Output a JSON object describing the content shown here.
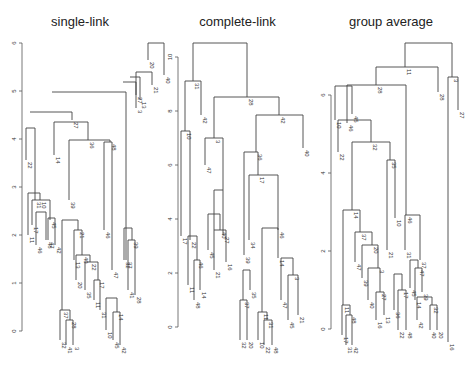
{
  "chart_data": [
    {
      "type": "dendrogram",
      "title": "single-link",
      "ylabel": "",
      "ylim": [
        0,
        6
      ],
      "yticks": [
        "0",
        "1",
        "2",
        "3",
        "4",
        "5",
        "6"
      ],
      "axis": {
        "x": 22,
        "y0": 331,
        "y_top": 43,
        "px_per_unit": 48
      },
      "leaf_labels_visible": [
        "22",
        "11",
        "17",
        "31",
        "46",
        "10",
        "48",
        "47",
        "45",
        "14",
        "42",
        "32",
        "37",
        "41",
        "39",
        "28",
        "27",
        "3",
        "13",
        "20",
        "21",
        "40",
        "35",
        "36"
      ],
      "segments": [
        [
          148,
          43,
          164,
          43
        ],
        [
          148,
          43,
          148,
          60
        ],
        [
          164,
          43,
          164,
          75
        ],
        [
          136,
          72,
          152,
          72
        ],
        [
          152,
          72,
          152,
          85
        ],
        [
          136,
          72,
          136,
          95
        ],
        [
          130,
          77,
          140,
          77
        ],
        [
          140,
          77,
          140,
          100
        ],
        [
          123,
          82,
          136,
          82
        ],
        [
          136,
          82,
          136,
          108
        ],
        [
          52,
          92,
          126,
          92
        ],
        [
          126,
          92,
          126,
          260
        ],
        [
          30,
          112,
          72,
          112
        ],
        [
          72,
          112,
          72,
          120
        ],
        [
          26,
          128,
          35,
          128
        ],
        [
          26,
          128,
          26,
          160
        ],
        [
          35,
          128,
          35,
          200
        ],
        [
          54,
          122,
          88,
          122
        ],
        [
          54,
          122,
          54,
          155
        ],
        [
          88,
          122,
          88,
          140
        ],
        [
          69,
          140,
          110,
          140
        ],
        [
          69,
          140,
          69,
          200
        ],
        [
          110,
          140,
          110,
          142
        ],
        [
          104,
          142,
          112,
          142
        ],
        [
          104,
          142,
          104,
          230
        ],
        [
          112,
          142,
          112,
          270
        ],
        [
          28,
          193,
          40,
          193
        ],
        [
          28,
          193,
          28,
          235
        ],
        [
          40,
          193,
          40,
          200
        ],
        [
          32,
          200,
          50,
          200
        ],
        [
          32,
          200,
          32,
          225
        ],
        [
          50,
          200,
          50,
          220
        ],
        [
          36,
          212,
          46,
          212
        ],
        [
          36,
          212,
          36,
          245
        ],
        [
          46,
          212,
          46,
          240
        ],
        [
          48,
          218,
          55,
          218
        ],
        [
          48,
          218,
          48,
          240
        ],
        [
          55,
          218,
          55,
          245
        ],
        [
          62,
          220,
          78,
          220
        ],
        [
          62,
          220,
          62,
          310
        ],
        [
          78,
          220,
          78,
          230
        ],
        [
          74,
          230,
          82,
          230
        ],
        [
          74,
          230,
          74,
          260
        ],
        [
          82,
          230,
          82,
          255
        ],
        [
          76,
          255,
          90,
          255
        ],
        [
          76,
          255,
          76,
          280
        ],
        [
          90,
          255,
          90,
          262
        ],
        [
          85,
          262,
          98,
          262
        ],
        [
          85,
          262,
          85,
          290
        ],
        [
          98,
          262,
          98,
          280
        ],
        [
          94,
          280,
          100,
          280
        ],
        [
          94,
          280,
          94,
          300
        ],
        [
          100,
          280,
          100,
          310
        ],
        [
          60,
          310,
          70,
          310
        ],
        [
          60,
          310,
          60,
          340
        ],
        [
          70,
          310,
          70,
          320
        ],
        [
          66,
          320,
          73,
          320
        ],
        [
          66,
          320,
          66,
          345
        ],
        [
          73,
          320,
          73,
          345
        ],
        [
          106,
          298,
          117,
          298
        ],
        [
          106,
          298,
          106,
          330
        ],
        [
          117,
          298,
          117,
          312
        ],
        [
          113,
          312,
          120,
          312
        ],
        [
          113,
          312,
          113,
          340
        ],
        [
          120,
          312,
          120,
          345
        ],
        [
          124,
          228,
          132,
          228
        ],
        [
          124,
          228,
          124,
          260
        ],
        [
          132,
          228,
          132,
          240
        ],
        [
          128,
          240,
          135,
          240
        ],
        [
          128,
          240,
          128,
          290
        ],
        [
          135,
          240,
          135,
          295
        ]
      ]
    },
    {
      "type": "dendrogram",
      "title": "complete-link",
      "ylabel": "",
      "ylim": [
        0,
        10
      ],
      "yticks": [
        "0",
        "2",
        "4",
        "6",
        "8",
        "10"
      ],
      "axis": {
        "x": 178,
        "y0": 327,
        "y_top": 57,
        "px_per_unit": 27
      },
      "leaf_labels_visible": [
        "17",
        "10",
        "11",
        "22",
        "31",
        "48",
        "46",
        "14",
        "42",
        "47",
        "45",
        "3",
        "21",
        "40",
        "27",
        "16",
        "32",
        "37",
        "39",
        "28",
        "20",
        "34",
        "35",
        "36"
      ],
      "segments": [
        [
          193,
          43,
          247,
          43
        ],
        [
          193,
          43,
          193,
          81
        ],
        [
          247,
          43,
          247,
          97
        ],
        [
          185,
          81,
          201,
          81
        ],
        [
          185,
          81,
          185,
          131
        ],
        [
          201,
          81,
          201,
          115
        ],
        [
          214,
          97,
          279,
          97
        ],
        [
          214,
          97,
          214,
          138
        ],
        [
          279,
          97,
          279,
          115
        ],
        [
          256,
          115,
          303,
          115
        ],
        [
          256,
          115,
          256,
          152
        ],
        [
          303,
          115,
          303,
          148
        ],
        [
          181,
          131,
          190,
          131
        ],
        [
          181,
          131,
          181,
          236
        ],
        [
          190,
          131,
          190,
          240
        ],
        [
          205,
          138,
          223,
          138
        ],
        [
          205,
          138,
          205,
          165
        ],
        [
          223,
          138,
          223,
          190
        ],
        [
          244,
          152,
          258,
          152
        ],
        [
          244,
          152,
          244,
          255
        ],
        [
          258,
          152,
          258,
          175
        ],
        [
          249,
          175,
          278,
          175
        ],
        [
          249,
          175,
          249,
          240
        ],
        [
          278,
          175,
          278,
          230
        ],
        [
          214,
          190,
          223,
          190
        ],
        [
          214,
          190,
          214,
          230
        ],
        [
          223,
          190,
          223,
          235
        ],
        [
          208,
          214,
          220,
          214
        ],
        [
          208,
          214,
          208,
          250
        ],
        [
          220,
          214,
          220,
          230
        ],
        [
          214,
          230,
          226,
          230
        ],
        [
          214,
          230,
          214,
          270
        ],
        [
          226,
          230,
          226,
          262
        ],
        [
          188,
          236,
          197,
          236
        ],
        [
          188,
          236,
          188,
          285
        ],
        [
          197,
          236,
          197,
          260
        ],
        [
          194,
          260,
          200,
          260
        ],
        [
          194,
          260,
          194,
          300
        ],
        [
          200,
          260,
          200,
          290
        ],
        [
          243,
          270,
          250,
          270
        ],
        [
          243,
          270,
          243,
          300
        ],
        [
          250,
          270,
          250,
          290
        ],
        [
          262,
          228,
          278,
          228
        ],
        [
          262,
          228,
          262,
          312
        ],
        [
          278,
          228,
          278,
          258
        ],
        [
          281,
          258,
          293,
          258
        ],
        [
          281,
          258,
          281,
          300
        ],
        [
          293,
          258,
          293,
          275
        ],
        [
          288,
          275,
          298,
          275
        ],
        [
          288,
          275,
          288,
          320
        ],
        [
          298,
          275,
          298,
          315
        ],
        [
          258,
          312,
          267,
          312
        ],
        [
          258,
          312,
          258,
          340
        ],
        [
          267,
          312,
          267,
          320
        ],
        [
          264,
          320,
          272,
          320
        ],
        [
          264,
          320,
          264,
          345
        ],
        [
          272,
          320,
          272,
          345
        ],
        [
          240,
          300,
          247,
          300
        ],
        [
          240,
          300,
          240,
          340
        ],
        [
          247,
          300,
          247,
          340
        ]
      ]
    },
    {
      "type": "dendrogram",
      "title": "group average",
      "ylabel": "",
      "ylim": [
        0,
        6
      ],
      "yticks": [
        "0",
        "2",
        "4",
        "6"
      ],
      "axis": {
        "x": 331,
        "y0": 329,
        "y_top": 93,
        "px_per_unit": 39
      },
      "leaf_labels_visible": [
        "10",
        "22",
        "17",
        "11",
        "31",
        "46",
        "48",
        "45",
        "14",
        "42",
        "47",
        "37",
        "39",
        "40",
        "32",
        "20",
        "28",
        "16",
        "3",
        "27",
        "13",
        "21",
        "35",
        "36"
      ],
      "segments": [
        [
          405,
          43,
          452,
          43
        ],
        [
          405,
          43,
          405,
          67
        ],
        [
          452,
          43,
          452,
          77
        ],
        [
          376,
          67,
          438,
          67
        ],
        [
          376,
          67,
          376,
          85
        ],
        [
          438,
          67,
          438,
          92
        ],
        [
          347,
          85,
          406,
          85
        ],
        [
          347,
          85,
          347,
          123
        ],
        [
          406,
          85,
          406,
          215
        ],
        [
          448,
          77,
          458,
          77
        ],
        [
          448,
          77,
          448,
          342
        ],
        [
          458,
          77,
          458,
          110
        ],
        [
          335,
          86,
          352,
          86
        ],
        [
          335,
          86,
          335,
          120
        ],
        [
          352,
          86,
          352,
          114
        ],
        [
          338,
          120,
          371,
          120
        ],
        [
          338,
          120,
          338,
          152
        ],
        [
          371,
          120,
          371,
          142
        ],
        [
          352,
          142,
          390,
          142
        ],
        [
          352,
          142,
          352,
          210
        ],
        [
          390,
          142,
          390,
          160
        ],
        [
          387,
          160,
          395,
          160
        ],
        [
          387,
          160,
          387,
          250
        ],
        [
          395,
          160,
          395,
          218
        ],
        [
          405,
          215,
          420,
          215
        ],
        [
          405,
          215,
          405,
          250
        ],
        [
          420,
          215,
          420,
          260
        ],
        [
          410,
          260,
          418,
          260
        ],
        [
          410,
          260,
          410,
          288
        ],
        [
          418,
          260,
          418,
          268
        ],
        [
          415,
          268,
          422,
          268
        ],
        [
          415,
          268,
          415,
          300
        ],
        [
          422,
          268,
          422,
          292
        ],
        [
          343,
          210,
          360,
          210
        ],
        [
          343,
          210,
          343,
          305
        ],
        [
          360,
          210,
          360,
          232
        ],
        [
          355,
          232,
          372,
          232
        ],
        [
          355,
          232,
          355,
          262
        ],
        [
          372,
          232,
          372,
          245
        ],
        [
          362,
          245,
          378,
          245
        ],
        [
          362,
          245,
          362,
          278
        ],
        [
          378,
          245,
          378,
          268
        ],
        [
          368,
          268,
          380,
          268
        ],
        [
          368,
          268,
          368,
          300
        ],
        [
          380,
          268,
          380,
          292
        ],
        [
          376,
          292,
          384,
          292
        ],
        [
          376,
          292,
          376,
          320
        ],
        [
          384,
          292,
          384,
          315
        ],
        [
          394,
          274,
          402,
          274
        ],
        [
          394,
          274,
          394,
          310
        ],
        [
          402,
          274,
          402,
          290
        ],
        [
          398,
          290,
          406,
          290
        ],
        [
          398,
          290,
          398,
          330
        ],
        [
          406,
          290,
          406,
          330
        ],
        [
          342,
          305,
          350,
          305
        ],
        [
          342,
          305,
          342,
          335
        ],
        [
          350,
          305,
          350,
          315
        ],
        [
          346,
          315,
          352,
          315
        ],
        [
          346,
          315,
          346,
          345
        ],
        [
          352,
          315,
          352,
          345
        ],
        [
          417,
          297,
          432,
          297
        ],
        [
          417,
          297,
          417,
          320
        ],
        [
          432,
          297,
          432,
          305
        ],
        [
          430,
          305,
          437,
          305
        ],
        [
          430,
          305,
          430,
          330
        ],
        [
          437,
          305,
          437,
          330
        ]
      ]
    }
  ]
}
